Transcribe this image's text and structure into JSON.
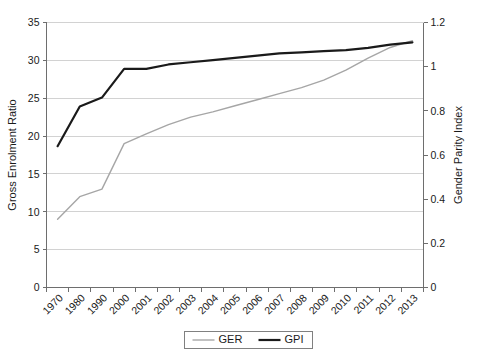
{
  "chart_data": {
    "type": "line",
    "title": "",
    "xlabel": "",
    "ylabel": "Gross Enrolment Ratio",
    "y2label": "Gender Parity Index",
    "grid": true,
    "legend_position": "bottom-center",
    "categories": [
      "1970",
      "1980",
      "1990",
      "2000",
      "2001",
      "2002",
      "2003",
      "2004",
      "2005",
      "2006",
      "2007",
      "2008",
      "2009",
      "2010",
      "2011",
      "2012",
      "2013"
    ],
    "ylim": [
      0,
      35
    ],
    "yticks": [
      "0",
      "5",
      "10",
      "15",
      "20",
      "25",
      "30",
      "35"
    ],
    "ytick_values": [
      0,
      5,
      10,
      15,
      20,
      25,
      30,
      35
    ],
    "y2lim": [
      0,
      1.2
    ],
    "y2ticks": [
      "0",
      "0.2",
      "0.4",
      "0.6",
      "0.8",
      "1",
      "1.2"
    ],
    "y2tick_values": [
      0,
      0.2,
      0.4,
      0.6,
      0.8,
      1.0,
      1.2
    ],
    "series": [
      {
        "name": "GER",
        "axis": "left",
        "color": "#a6a6a6",
        "width": 1.4,
        "values": [
          9.0,
          12.0,
          13.0,
          19.0,
          20.3,
          21.5,
          22.5,
          23.2,
          24.0,
          24.8,
          25.6,
          26.4,
          27.4,
          28.7,
          30.3,
          31.7,
          32.6
        ]
      },
      {
        "name": "GPI",
        "axis": "right",
        "color": "#1a1a1a",
        "width": 2.2,
        "values": [
          0.64,
          0.82,
          0.86,
          0.99,
          0.99,
          1.01,
          1.02,
          1.03,
          1.04,
          1.05,
          1.06,
          1.065,
          1.07,
          1.075,
          1.085,
          1.1,
          1.11
        ]
      }
    ]
  },
  "legend": {
    "entries": [
      {
        "label": "GER",
        "color": "#a6a6a6",
        "width": 1.4
      },
      {
        "label": "GPI",
        "color": "#1a1a1a",
        "width": 2.2
      }
    ]
  }
}
